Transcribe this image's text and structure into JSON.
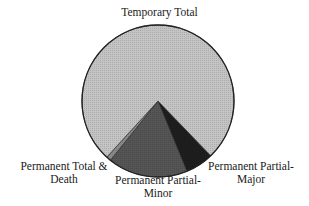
{
  "chart_data": {
    "type": "pie",
    "title": "",
    "center": [
      158,
      101
    ],
    "radius": 76,
    "start_angle_deg": 136,
    "slices": [
      {
        "label": "Permanent Partial-Major",
        "value": 6,
        "color": "#1e1e1e"
      },
      {
        "label": "Permanent Partial-Minor",
        "value": 17,
        "color": "#555555"
      },
      {
        "label": "Permanent Total & Death",
        "value": 1,
        "color": "#8a8a8a"
      },
      {
        "label": "Temporary Total",
        "value": 76,
        "color": "#c4c4c4"
      }
    ],
    "legend": "none",
    "labels_outside": true
  },
  "labels": {
    "temporary_total": "Temporary Total",
    "pp_major_1": "Permanent Partial-",
    "pp_major_2": "Major",
    "pp_minor_1": "Permanent Partial-",
    "pp_minor_2": "Minor",
    "pt_death_1": "Permanent Total &",
    "pt_death_2": "Death"
  }
}
